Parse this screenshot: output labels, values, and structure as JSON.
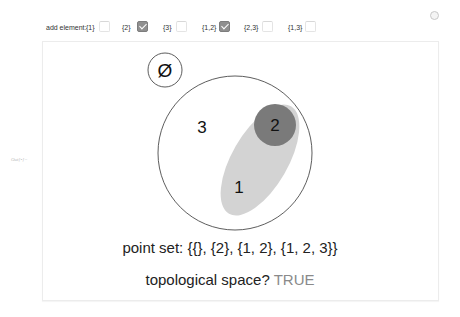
{
  "controls": {
    "add_element_label": "add element:",
    "options": [
      {
        "label": "{1}",
        "checked": false
      },
      {
        "label": "{2}",
        "checked": true
      },
      {
        "label": "{3}",
        "checked": false
      },
      {
        "label": "{1,2}",
        "checked": true
      },
      {
        "label": "{2,3}",
        "checked": false
      },
      {
        "label": "{1,3}",
        "checked": false
      }
    ]
  },
  "output_label": "Out[•]=",
  "diagram": {
    "empty_set_symbol": "Ø",
    "regions": [
      {
        "label": "3",
        "set": "{1, 2, 3}",
        "fill": "#ffffff"
      },
      {
        "label": "1",
        "set": "{1, 2}",
        "fill": "#d3d3d3"
      },
      {
        "label": "2",
        "set": "{2}",
        "fill": "#7a7a7a"
      }
    ]
  },
  "result": {
    "point_set_label": "point set:",
    "point_set_value": "{{}, {2}, {1, 2}, {1, 2, 3}}",
    "topological_label": "topological space?",
    "topological_value": "TRUE"
  },
  "colors": {
    "true_value": "#8a8a8a",
    "set_2_fill": "#7a7a7a",
    "set_12_fill": "#d3d3d3",
    "checkbox_checked": "#8f8f8f"
  }
}
